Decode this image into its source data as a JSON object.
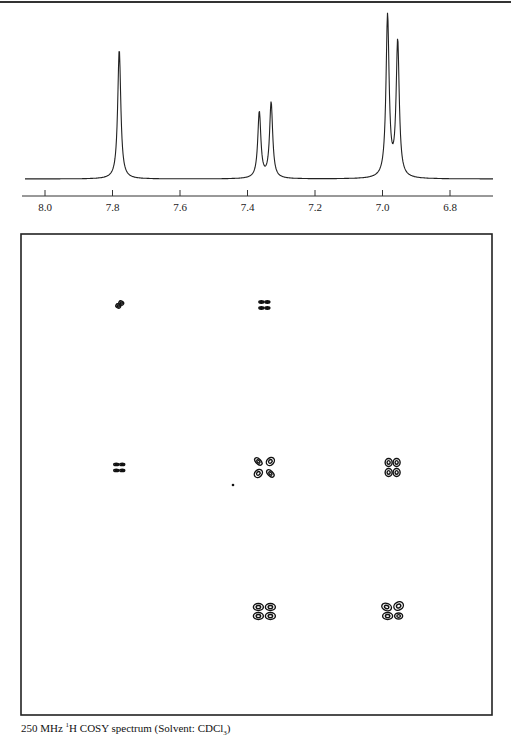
{
  "caption": {
    "freq": "250 MHz",
    "sup": "1",
    "nucleus_text": "H COSY spectrum (Solvent: CDCl",
    "sub": "3",
    "close": ")"
  },
  "chart_data": [
    {
      "type": "line",
      "title": "1D 1H NMR spectrum",
      "xlabel": "ppm",
      "ylabel": "",
      "x_reversed": true,
      "xlim": [
        8.06,
        6.67
      ],
      "xticks": [
        8.0,
        7.8,
        7.6,
        7.4,
        7.2,
        7.0,
        6.8
      ],
      "xtick_labels": [
        "8.0",
        "7.8",
        "7.6",
        "7.4",
        "7.2",
        "7.0",
        "6.8"
      ],
      "grid": false,
      "peaks": [
        {
          "ppm": 7.78,
          "relative_height": 0.8,
          "multiplicity": "singlet (slightly split)"
        },
        {
          "ppm": 7.365,
          "relative_height": 0.41,
          "multiplicity": "doublet component"
        },
        {
          "ppm": 7.33,
          "relative_height": 0.47,
          "multiplicity": "doublet component"
        },
        {
          "ppm": 6.985,
          "relative_height": 1.0,
          "multiplicity": "doublet component"
        },
        {
          "ppm": 6.955,
          "relative_height": 0.84,
          "multiplicity": "doublet component"
        }
      ]
    },
    {
      "type": "heatmap",
      "title": "2D COSY contour plot",
      "xlabel": "ppm",
      "ylabel": "ppm",
      "description": "Contour cross peaks; diagonal from top-left to bottom-right",
      "cross_peaks": [
        {
          "f2_ppm": 7.78,
          "f1_ppm": 7.78,
          "kind": "diagonal"
        },
        {
          "f2_ppm": 7.35,
          "f1_ppm": 7.78,
          "kind": "cross"
        },
        {
          "f2_ppm": 7.78,
          "f1_ppm": 7.35,
          "kind": "cross"
        },
        {
          "f2_ppm": 7.35,
          "f1_ppm": 7.35,
          "kind": "diagonal"
        },
        {
          "f2_ppm": 6.97,
          "f1_ppm": 7.35,
          "kind": "cross"
        },
        {
          "f2_ppm": 7.35,
          "f1_ppm": 6.97,
          "kind": "cross"
        },
        {
          "f2_ppm": 6.97,
          "f1_ppm": 6.97,
          "kind": "diagonal"
        }
      ]
    }
  ]
}
